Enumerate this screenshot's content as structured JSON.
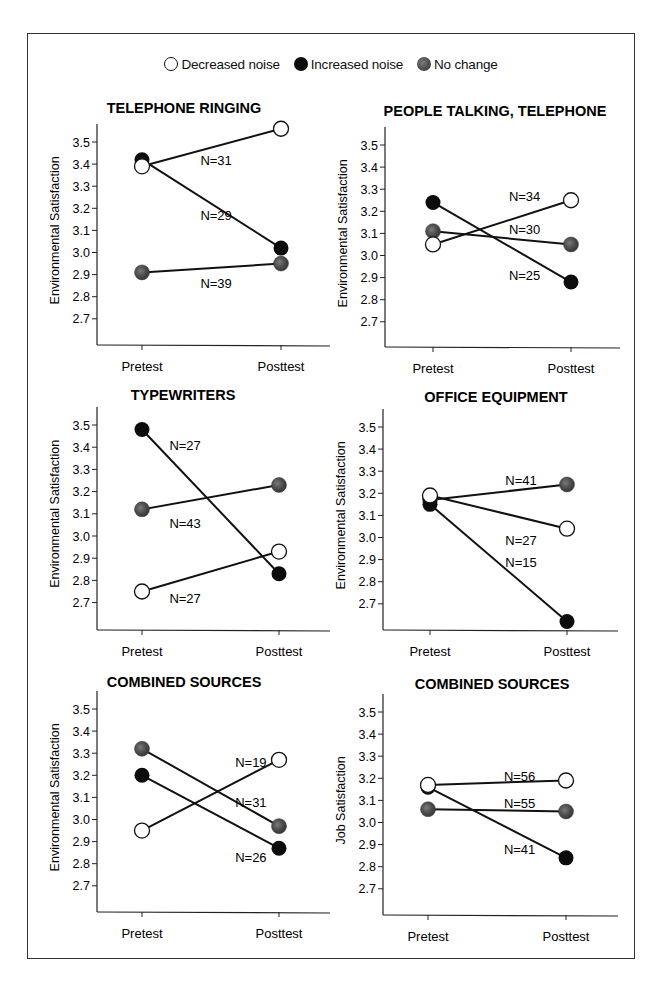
{
  "legend": {
    "decreased": "Decreased noise",
    "increased": "Increased noise",
    "no_change": "No change"
  },
  "colors": {
    "decreased_fill": "#ffffff",
    "increased_fill": "#0c0c0c",
    "no_change_fill": "#555555",
    "line": "#111111",
    "frame": "#333333"
  },
  "chart_data": [
    {
      "type": "line",
      "title": "TELEPHONE RINGING",
      "xlabel": "",
      "ylabel": "Environmental Satisfaction",
      "categories": [
        "Pretest",
        "Posttest"
      ],
      "yticks": [
        "3.5",
        "3.4",
        "3.3",
        "3.2",
        "3.1",
        "3.0",
        "2.9",
        "2.8",
        "2.7"
      ],
      "ylim": [
        2.6,
        3.55
      ],
      "grid": false,
      "series": [
        {
          "name": "Decreased noise",
          "values": [
            3.39,
            3.56
          ],
          "n_label": "N=31",
          "label_pos": [
            0.42,
            3.42
          ]
        },
        {
          "name": "Increased noise",
          "values": [
            3.42,
            3.02
          ],
          "n_label": "N=29",
          "label_pos": [
            0.42,
            3.17
          ]
        },
        {
          "name": "No change",
          "values": [
            2.91,
            2.95
          ],
          "n_label": "N=39",
          "label_pos": [
            0.42,
            2.86
          ]
        }
      ]
    },
    {
      "type": "line",
      "title": "PEOPLE TALKING, TELEPHONE",
      "xlabel": "",
      "ylabel": "Environmental Satisfaction",
      "categories": [
        "Pretest",
        "Posttest"
      ],
      "yticks": [
        "3.5",
        "3.4",
        "3.3",
        "3.2",
        "3.1",
        "3.0",
        "2.9",
        "2.8",
        "2.7"
      ],
      "ylim": [
        2.6,
        3.55
      ],
      "grid": false,
      "series": [
        {
          "name": "Decreased noise",
          "values": [
            3.05,
            3.25
          ],
          "n_label": "N=34",
          "label_pos": [
            0.55,
            3.27
          ]
        },
        {
          "name": "Increased noise",
          "values": [
            3.24,
            2.88
          ],
          "n_label": "N=25",
          "label_pos": [
            0.55,
            2.91
          ]
        },
        {
          "name": "No change",
          "values": [
            3.11,
            3.05
          ],
          "n_label": "N=30",
          "label_pos": [
            0.55,
            3.12
          ]
        }
      ]
    },
    {
      "type": "line",
      "title": "TYPEWRITERS",
      "xlabel": "",
      "ylabel": "Environmental Satisfaction",
      "categories": [
        "Pretest",
        "Posttest"
      ],
      "yticks": [
        "3.5",
        "3.4",
        "3.3",
        "3.2",
        "3.1",
        "3.0",
        "2.9",
        "2.8",
        "2.7"
      ],
      "ylim": [
        2.6,
        3.55
      ],
      "grid": false,
      "series": [
        {
          "name": "Decreased noise",
          "values": [
            2.75,
            2.93
          ],
          "n_label": "N=27",
          "label_pos": [
            0.2,
            2.72
          ]
        },
        {
          "name": "Increased noise",
          "values": [
            3.48,
            2.83
          ],
          "n_label": "N=27",
          "label_pos": [
            0.2,
            3.41
          ]
        },
        {
          "name": "No change",
          "values": [
            3.12,
            3.23
          ],
          "n_label": "N=43",
          "label_pos": [
            0.2,
            3.06
          ]
        }
      ]
    },
    {
      "type": "line",
      "title": "OFFICE EQUIPMENT",
      "xlabel": "",
      "ylabel": "Environmental Satisfaction",
      "categories": [
        "Pretest",
        "Posttest"
      ],
      "yticks": [
        "3.5",
        "3.4",
        "3.3",
        "3.2",
        "3.1",
        "3.0",
        "2.9",
        "2.8",
        "2.7"
      ],
      "ylim": [
        2.6,
        3.55
      ],
      "grid": false,
      "series": [
        {
          "name": "Decreased noise",
          "values": [
            3.19,
            3.04
          ],
          "n_label": "N=27",
          "label_pos": [
            0.55,
            2.99
          ]
        },
        {
          "name": "Increased noise",
          "values": [
            3.15,
            2.62
          ],
          "n_label": "N=15",
          "label_pos": [
            0.55,
            2.89
          ]
        },
        {
          "name": "No change",
          "values": [
            3.17,
            3.24
          ],
          "n_label": "N=41",
          "label_pos": [
            0.55,
            3.26
          ]
        }
      ]
    },
    {
      "type": "line",
      "title": "COMBINED SOURCES",
      "xlabel": "",
      "ylabel": "Environmental Satisfaction",
      "categories": [
        "Pretest",
        "Posttest"
      ],
      "yticks": [
        "3.5",
        "3.4",
        "3.3",
        "3.2",
        "3.1",
        "3.0",
        "2.9",
        "2.8",
        "2.7"
      ],
      "ylim": [
        2.6,
        3.55
      ],
      "grid": false,
      "series": [
        {
          "name": "Decreased noise",
          "values": [
            2.95,
            3.27
          ],
          "n_label": "N=19",
          "label_pos": [
            0.68,
            3.26
          ]
        },
        {
          "name": "Increased noise",
          "values": [
            3.2,
            2.87
          ],
          "n_label": "N=26",
          "label_pos": [
            0.68,
            2.83
          ]
        },
        {
          "name": "No change",
          "values": [
            3.32,
            2.97
          ],
          "n_label": "N=31",
          "label_pos": [
            0.68,
            3.08
          ]
        }
      ]
    },
    {
      "type": "line",
      "title": "COMBINED SOURCES",
      "xlabel": "",
      "ylabel": "Job Satisfaction",
      "categories": [
        "Pretest",
        "Posttest"
      ],
      "yticks": [
        "3.5",
        "3.4",
        "3.3",
        "3.2",
        "3.1",
        "3.0",
        "2.9",
        "2.8",
        "2.7"
      ],
      "ylim": [
        2.6,
        3.55
      ],
      "grid": false,
      "series": [
        {
          "name": "Decreased noise",
          "values": [
            3.17,
            3.19
          ],
          "n_label": "N=56",
          "label_pos": [
            0.55,
            3.21
          ]
        },
        {
          "name": "Increased noise",
          "values": [
            3.16,
            2.84
          ],
          "n_label": "N=41",
          "label_pos": [
            0.55,
            2.88
          ]
        },
        {
          "name": "No change",
          "values": [
            3.06,
            3.05
          ],
          "n_label": "N=55",
          "label_pos": [
            0.55,
            3.09
          ]
        }
      ]
    }
  ]
}
